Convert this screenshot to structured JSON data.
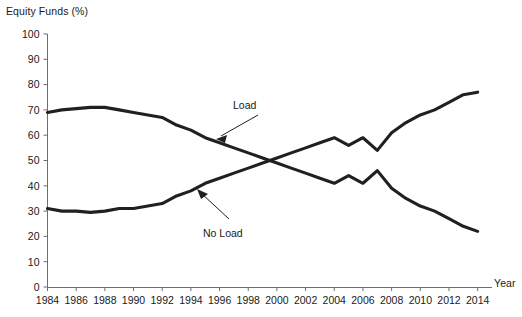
{
  "chart_data": {
    "type": "line",
    "title": "",
    "ylabel": "Equity Funds (%)",
    "xlabel": "Year",
    "ylim": [
      0,
      100
    ],
    "xlim": [
      1984,
      2015
    ],
    "ytick_step": 10,
    "xtick_step": 2,
    "grid": false,
    "legend": "inline-annotations",
    "yticks": [
      "0",
      "10",
      "20",
      "30",
      "40",
      "50",
      "60",
      "70",
      "80",
      "90",
      "100"
    ],
    "xticks": [
      "1984",
      "1986",
      "1988",
      "1990",
      "1992",
      "1994",
      "1996",
      "1998",
      "2000",
      "2002",
      "2004",
      "2006",
      "2008",
      "2010",
      "2012",
      "2014"
    ],
    "x": [
      1984,
      1985,
      1986,
      1987,
      1988,
      1989,
      1990,
      1991,
      1992,
      1993,
      1994,
      1995,
      1996,
      1997,
      1998,
      1999,
      2000,
      2001,
      2002,
      2003,
      2004,
      2005,
      2006,
      2007,
      2008,
      2009,
      2010,
      2011,
      2012,
      2013,
      2014
    ],
    "series": [
      {
        "name": "Load",
        "color": "#231f20",
        "values": [
          69,
          70,
          70.5,
          71,
          71,
          70,
          69,
          68,
          67,
          64,
          62,
          59,
          57,
          55,
          53,
          51,
          49,
          47,
          45,
          43,
          41,
          44,
          41,
          46,
          39,
          35,
          32,
          30,
          27,
          24,
          22
        ]
      },
      {
        "name": "No Load",
        "color": "#231f20",
        "values": [
          31,
          30,
          30,
          29.5,
          30,
          31,
          31,
          32,
          33,
          36,
          38,
          41,
          43,
          45,
          47,
          49,
          51,
          53,
          55,
          57,
          59,
          56,
          59,
          54,
          61,
          65,
          68,
          70,
          73,
          76,
          77
        ]
      }
    ],
    "annotations": [
      {
        "label": "Load",
        "target_year": 1997,
        "target_value": 55,
        "description": "arrow pointing down-left to the declining Load series"
      },
      {
        "label": "No Load",
        "target_year": 1995,
        "target_value": 41,
        "description": "arrow pointing up-left to the rising No Load series"
      }
    ]
  }
}
